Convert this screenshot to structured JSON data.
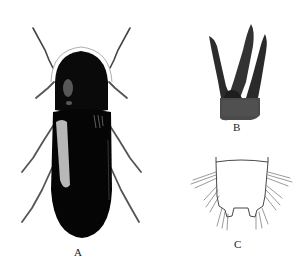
{
  "figure": {
    "panels": [
      {
        "id": "A",
        "label": "A",
        "subject": "beetle dorsal habitus"
      },
      {
        "id": "B",
        "label": "B",
        "subject": "male genitalia (aedeagus)"
      },
      {
        "id": "C",
        "label": "C",
        "subject": "terminal abdominal segment with setae"
      }
    ]
  },
  "colors": {
    "background": "#ffffff",
    "body": "#0a0a0a",
    "highlight": "#d8d8d8",
    "genitalia": "#3a3a3a",
    "line": "#333333"
  }
}
